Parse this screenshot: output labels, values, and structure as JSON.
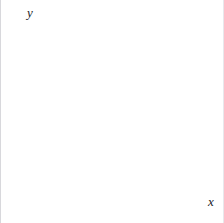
{
  "figure": {
    "background_color": "#ffffff",
    "grid_color": "#e6e6ea",
    "axis_color": "#8d8d95"
  },
  "axes": {
    "x_label": "x",
    "y_label": "y",
    "x_ticks": [
      "1",
      "2",
      "3",
      "4",
      "5",
      "6",
      "7",
      "8",
      "9",
      "10"
    ],
    "y_ticks": [
      "1",
      "2",
      "3",
      "4",
      "5",
      "6",
      "7",
      "8",
      "9",
      "10"
    ],
    "origin_label": "0"
  },
  "chart_data": {
    "type": "scatter",
    "title": "",
    "xlabel": "x",
    "ylabel": "y",
    "xlim": [
      0,
      10
    ],
    "ylim": [
      0,
      10
    ],
    "grid": true,
    "legend": "none",
    "x_ticks": [
      0,
      1,
      2,
      3,
      4,
      5,
      6,
      7,
      8,
      9,
      10
    ],
    "y_ticks": [
      0,
      1,
      2,
      3,
      4,
      5,
      6,
      7,
      8,
      9,
      10
    ],
    "shapes": [
      {
        "name": "A",
        "label": "A",
        "label_position": [
          6.5,
          6.5
        ],
        "fill": "#eeeeee",
        "stroke": "#2a2a2e",
        "vertices": [
          [
            6,
            6
          ],
          [
            6,
            9
          ],
          [
            7,
            9
          ],
          [
            7,
            7
          ],
          [
            8,
            7
          ],
          [
            8,
            6
          ]
        ]
      }
    ]
  }
}
